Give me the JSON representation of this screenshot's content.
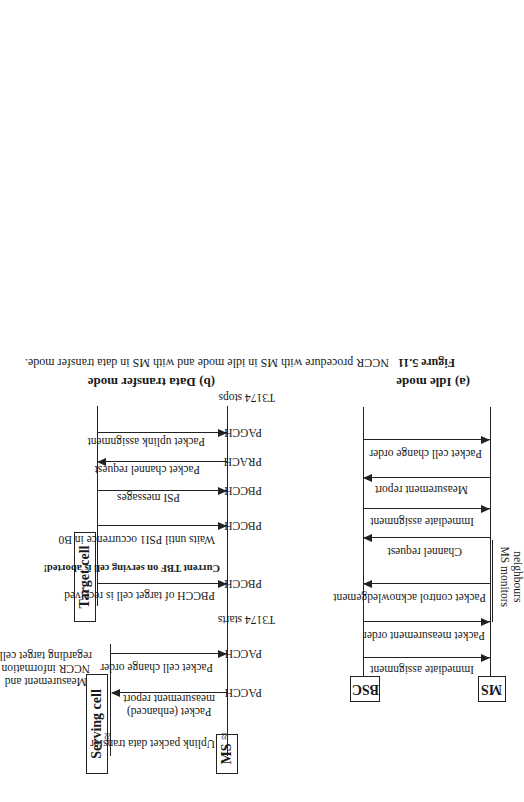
{
  "figure": {
    "number": "Figure 5.11",
    "caption": "NCCR procedure with MS in idle mode and with MS in data transfer mode."
  },
  "panel_a": {
    "title": "(a) Idle mode",
    "entities": {
      "ms": "MS",
      "bsc": "BSC"
    },
    "side_note": [
      "MS monitors",
      "neighbours"
    ],
    "messages": [
      {
        "label": "Immediate assignment",
        "direction": "BSC->MS"
      },
      {
        "label": "Packet measurement order",
        "direction": "BSC->MS"
      },
      {
        "label": "Packet control acknowledgement",
        "direction": "MS->BSC"
      },
      {
        "label": "Channel request",
        "direction": "MS->BSC"
      },
      {
        "label": "Immediate assignment",
        "direction": "BSC->MS"
      },
      {
        "label": "Measurement report",
        "direction": "MS->BSC"
      },
      {
        "label": "Packet cell change order",
        "direction": "BSC->MS"
      }
    ]
  },
  "panel_b": {
    "title": "(b) Data transfer mode",
    "entities": {
      "ms": "MS",
      "serving": "Serving cell",
      "target": "Target cell"
    },
    "top_note": "Uplink packet data transfer",
    "serving_note": [
      "Measurement and",
      "NCCR information",
      "regarding target cell"
    ],
    "serving_messages": [
      {
        "label": [
          "Packet (enhanced)",
          "measurement report"
        ],
        "direction": "MS->Serving",
        "channel": "PACCH"
      },
      {
        "label": [
          "Packet cell change order"
        ],
        "direction": "Serving->MS",
        "channel": "PACCH"
      }
    ],
    "timer_start": "T3174 starts",
    "target_events": [
      {
        "label": "PBCCH of target cell is received",
        "direction": "Target->MS",
        "channel": "PBCCH",
        "bold": false
      },
      {
        "label": "Current TBF on serving cell is aborted!",
        "direction": "none",
        "channel": "",
        "bold": true
      },
      {
        "label": "Waits until PSI1 occurrence in B0",
        "direction": "Target->MS",
        "channel": "PBCCH",
        "bold": false
      },
      {
        "label": "PSI messages",
        "direction": "Target->MS",
        "channel": "PBCCH",
        "bold": false
      },
      {
        "label": "Packet channel request",
        "direction": "MS->Target",
        "channel": "PRACH",
        "bold": false
      },
      {
        "label": "Packet uplink assignment",
        "direction": "Target->MS",
        "channel": "PAGCH",
        "bold": false
      }
    ],
    "timer_stop": "T3174 stops"
  }
}
